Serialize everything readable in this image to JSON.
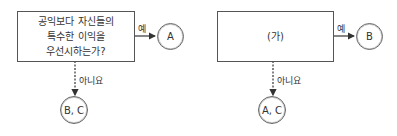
{
  "diagrams": [
    {
      "question": "공익보다 자신들의 특수한 이익을 우선시하는가?",
      "question_lines": [
        "공익보다 자신들의",
        "특수한 이익을",
        "우선시하는가?"
      ],
      "yes_label": "예",
      "yes_result": "A",
      "no_label": "아니요",
      "no_result": "B, C"
    },
    {
      "question": "(가)",
      "yes_label": "예",
      "yes_result": "B",
      "no_label": "아니요",
      "no_result": "A, C"
    }
  ]
}
